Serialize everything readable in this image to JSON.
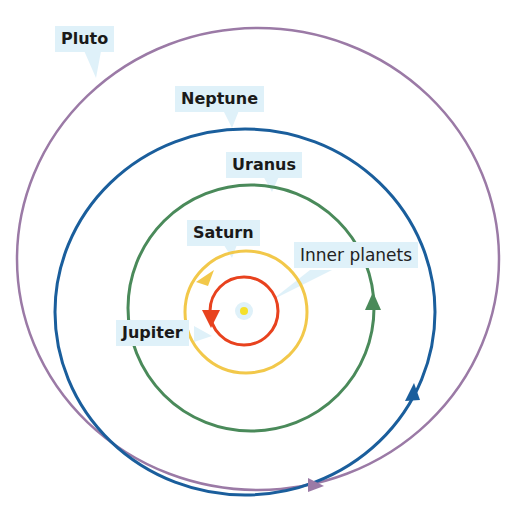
{
  "diagram": {
    "colors": {
      "pluto": "#9b7aa6",
      "neptune": "#1a5e9c",
      "uranus": "#4a8a5a",
      "saturn": "#f2c84a",
      "jupiter": "#e8421e",
      "sun": "#f5e02a",
      "label_bg": "#dff1f9"
    },
    "labels": {
      "pluto": "Pluto",
      "neptune": "Neptune",
      "uranus": "Uranus",
      "saturn": "Saturn",
      "inner": "Inner planets",
      "jupiter": "Jupiter"
    }
  }
}
